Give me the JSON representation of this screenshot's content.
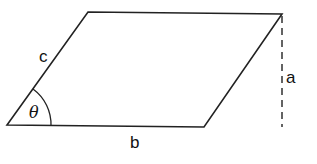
{
  "diagram": {
    "type": "parallelogram",
    "labels": {
      "side_c": "c",
      "side_b": "b",
      "height_a": "a",
      "angle": "θ"
    },
    "colors": {
      "stroke": "#222222",
      "background": "#ffffff"
    }
  }
}
